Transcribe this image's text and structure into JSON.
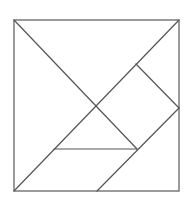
{
  "diagram": {
    "type": "tangram",
    "stroke_color": "#555555",
    "background": "#ffffff",
    "frame": {
      "x1": 14,
      "y1": 20,
      "x2": 179,
      "y2": 191
    },
    "pieces": [
      {
        "name": "large-triangle-left",
        "points": "14,20 96,106 14,191"
      },
      {
        "name": "large-triangle-top",
        "points": "14,20 179,20 96,106"
      },
      {
        "name": "square",
        "points": "136,64 179,108 137,149 96,106"
      },
      {
        "name": "small-triangle-right",
        "points": "136,64 179,20 179,108"
      },
      {
        "name": "small-triangle-center",
        "points": "96,106 137,149 54,149"
      },
      {
        "name": "parallelogram",
        "points": "14,191 54,149 137,149 97,191"
      },
      {
        "name": "medium-triangle",
        "points": "179,108 179,191 97,191"
      }
    ]
  }
}
